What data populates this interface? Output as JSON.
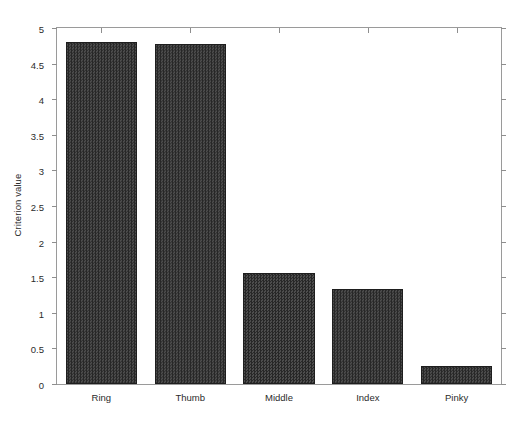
{
  "chart_data": {
    "type": "bar",
    "title": "",
    "xlabel": "",
    "ylabel": "Criterion value",
    "categories": [
      "Ring",
      "Thumb",
      "Middle",
      "Index",
      "Pinky"
    ],
    "values": [
      4.8,
      4.78,
      1.56,
      1.33,
      0.25
    ],
    "series": [
      {
        "name": "Criterion value",
        "values": [
          4.8,
          4.78,
          1.56,
          1.33,
          0.25
        ]
      }
    ],
    "ylim": [
      0,
      5
    ],
    "yticks": [
      0,
      0.5,
      1,
      1.5,
      2,
      2.5,
      3,
      3.5,
      4,
      4.5,
      5
    ],
    "ytick_labels": [
      "0",
      "0.5",
      "1",
      "1.5",
      "2",
      "2.5",
      "3",
      "3.5",
      "4",
      "4.5",
      "5"
    ],
    "grid": false,
    "legend": null,
    "legend_position": "none",
    "bar_color": "#3f3f3f",
    "bar_edge_color": "#1e1e1e",
    "axis_color": "#9a9a9a",
    "background_color": "#ffffff",
    "text_color": "#2b2b2b"
  }
}
